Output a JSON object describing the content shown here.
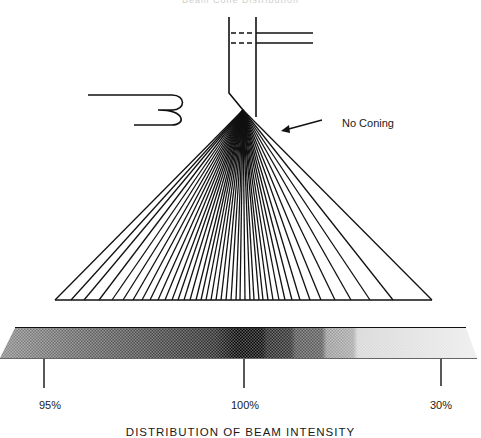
{
  "header": {
    "text": "Beam Cone Distribution"
  },
  "annotation": {
    "label": "No Coning"
  },
  "intensity_bar": {
    "caption": "DISTRIBUTION OF BEAM INTENSITY",
    "markers": [
      {
        "label": "95%",
        "x": 44
      },
      {
        "label": "100%",
        "x": 244
      },
      {
        "label": "30%",
        "x": 441
      }
    ]
  },
  "beam": {
    "apex": [
      243,
      110
    ],
    "base_y": 300,
    "base_x": [
      55,
      71,
      84,
      99,
      112,
      123,
      133,
      142,
      150,
      158,
      165,
      172,
      178,
      184,
      190,
      196,
      201,
      206,
      211,
      216,
      221,
      226,
      231,
      236,
      240,
      245,
      250,
      254,
      259,
      263,
      268,
      273,
      279,
      285,
      292,
      300,
      310,
      321,
      335,
      351,
      370,
      393,
      432
    ]
  },
  "colors": {
    "ink": "#111111",
    "paper": "#ffffff"
  }
}
